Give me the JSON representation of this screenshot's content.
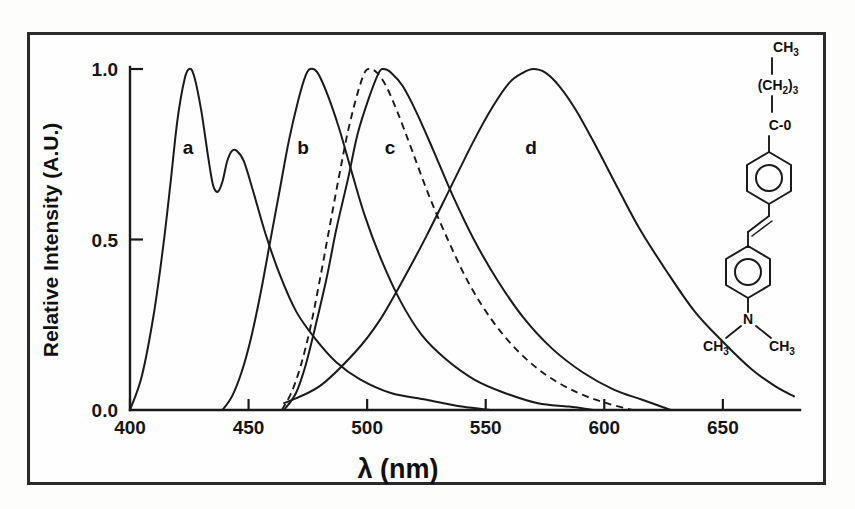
{
  "figure": {
    "frame_color": "#2b2b2b",
    "line_color": "#1a1a1a",
    "background": "#fefefe"
  },
  "axes": {
    "x_title": "λ (nm)",
    "y_title": "Relative Intensity (A.U.)",
    "x_ticks": [
      "400",
      "450",
      "500",
      "550",
      "600",
      "650"
    ],
    "y_ticks": [
      "0.0",
      "0.5",
      "1.0"
    ]
  },
  "curve_labels": [
    {
      "id": "a",
      "text": "a"
    },
    {
      "id": "b",
      "text": "b"
    },
    {
      "id": "c",
      "text": "c"
    },
    {
      "id": "d",
      "text": "d"
    }
  ],
  "molecule": {
    "name": "4-dimethylamino-4'-pentanoyl-stilbene",
    "labels": {
      "methyl_top": "CH",
      "methyl_top_sub": "3",
      "chain_open": "(CH",
      "chain_sub": "2",
      "chain_close": ")",
      "chain_count": "3",
      "carbonyl": "C-0",
      "nitrogen": "N",
      "methyl_left": "CH",
      "methyl_left_sub": "3",
      "methyl_right": "CH",
      "methyl_right_sub": "3"
    }
  },
  "chart_data": {
    "type": "line",
    "xlabel": "λ (nm)",
    "ylabel": "Relative Intensity (A.U.)",
    "xlim": [
      400,
      680
    ],
    "ylim": [
      0.0,
      1.0
    ],
    "grid": false,
    "legend": "inline curve labels a, b, c, d",
    "x_tick_values": [
      400,
      450,
      500,
      550,
      600,
      650
    ],
    "y_tick_values": [
      0.0,
      0.5,
      1.0
    ],
    "series": [
      {
        "name": "a",
        "style": "solid",
        "description": "vibronically structured absorption band with two maxima",
        "peak_nm": 425,
        "secondary_peak_nm": 443,
        "points": [
          [
            400,
            0.0
          ],
          [
            405,
            0.1
          ],
          [
            410,
            0.28
          ],
          [
            414,
            0.48
          ],
          [
            417,
            0.66
          ],
          [
            420,
            0.85
          ],
          [
            423,
            0.97
          ],
          [
            425,
            1.0
          ],
          [
            427,
            0.98
          ],
          [
            430,
            0.88
          ],
          [
            433,
            0.74
          ],
          [
            435,
            0.66
          ],
          [
            437,
            0.64
          ],
          [
            439,
            0.67
          ],
          [
            441,
            0.73
          ],
          [
            443,
            0.76
          ],
          [
            445,
            0.76
          ],
          [
            448,
            0.73
          ],
          [
            452,
            0.64
          ],
          [
            457,
            0.52
          ],
          [
            463,
            0.4
          ],
          [
            470,
            0.29
          ],
          [
            478,
            0.21
          ],
          [
            487,
            0.14
          ],
          [
            497,
            0.09
          ],
          [
            510,
            0.05
          ],
          [
            525,
            0.03
          ],
          [
            540,
            0.01
          ],
          [
            552,
            0.0
          ]
        ]
      },
      {
        "name": "b",
        "style": "solid",
        "description": "emission band",
        "peak_nm": 476,
        "points": [
          [
            439,
            0.0
          ],
          [
            443,
            0.04
          ],
          [
            447,
            0.11
          ],
          [
            451,
            0.21
          ],
          [
            455,
            0.34
          ],
          [
            459,
            0.49
          ],
          [
            463,
            0.64
          ],
          [
            467,
            0.79
          ],
          [
            471,
            0.91
          ],
          [
            474,
            0.98
          ],
          [
            476,
            1.0
          ],
          [
            479,
            0.99
          ],
          [
            483,
            0.93
          ],
          [
            488,
            0.83
          ],
          [
            493,
            0.71
          ],
          [
            499,
            0.57
          ],
          [
            506,
            0.44
          ],
          [
            514,
            0.32
          ],
          [
            523,
            0.22
          ],
          [
            533,
            0.15
          ],
          [
            545,
            0.09
          ],
          [
            558,
            0.05
          ],
          [
            572,
            0.02
          ],
          [
            585,
            0.01
          ],
          [
            596,
            0.0
          ]
        ]
      },
      {
        "name": "dashed",
        "style": "dashed",
        "description": "dashed reference band overlapping curve c, blue-shifted maximum",
        "peak_nm": 501,
        "points": [
          [
            464,
            0.0
          ],
          [
            468,
            0.05
          ],
          [
            472,
            0.13
          ],
          [
            476,
            0.24
          ],
          [
            480,
            0.38
          ],
          [
            484,
            0.53
          ],
          [
            488,
            0.68
          ],
          [
            492,
            0.82
          ],
          [
            496,
            0.93
          ],
          [
            499,
            0.99
          ],
          [
            501,
            1.0
          ],
          [
            504,
            0.99
          ],
          [
            508,
            0.95
          ],
          [
            513,
            0.87
          ],
          [
            519,
            0.76
          ],
          [
            526,
            0.63
          ],
          [
            534,
            0.5
          ],
          [
            543,
            0.37
          ],
          [
            553,
            0.26
          ],
          [
            564,
            0.17
          ],
          [
            576,
            0.1
          ],
          [
            589,
            0.05
          ],
          [
            601,
            0.02
          ],
          [
            612,
            0.0
          ]
        ]
      },
      {
        "name": "c",
        "style": "solid",
        "description": "emission band slightly red-shifted from dashed curve",
        "peak_nm": 507,
        "points": [
          [
            465,
            0.0
          ],
          [
            470,
            0.05
          ],
          [
            474,
            0.13
          ],
          [
            478,
            0.24
          ],
          [
            483,
            0.39
          ],
          [
            487,
            0.53
          ],
          [
            492,
            0.68
          ],
          [
            496,
            0.81
          ],
          [
            501,
            0.92
          ],
          [
            505,
            0.99
          ],
          [
            507,
            1.0
          ],
          [
            510,
            0.99
          ],
          [
            515,
            0.95
          ],
          [
            521,
            0.87
          ],
          [
            528,
            0.76
          ],
          [
            536,
            0.63
          ],
          [
            545,
            0.5
          ],
          [
            555,
            0.38
          ],
          [
            566,
            0.27
          ],
          [
            578,
            0.18
          ],
          [
            591,
            0.11
          ],
          [
            604,
            0.06
          ],
          [
            616,
            0.03
          ],
          [
            628,
            0.0
          ]
        ]
      },
      {
        "name": "d",
        "style": "solid",
        "description": "broad red-shifted emission band",
        "peak_nm": 570,
        "points": [
          [
            465,
            0.02
          ],
          [
            480,
            0.07
          ],
          [
            495,
            0.17
          ],
          [
            505,
            0.26
          ],
          [
            515,
            0.38
          ],
          [
            525,
            0.51
          ],
          [
            535,
            0.65
          ],
          [
            545,
            0.79
          ],
          [
            553,
            0.89
          ],
          [
            560,
            0.96
          ],
          [
            566,
            0.99
          ],
          [
            570,
            1.0
          ],
          [
            575,
            0.99
          ],
          [
            581,
            0.95
          ],
          [
            588,
            0.88
          ],
          [
            596,
            0.78
          ],
          [
            605,
            0.66
          ],
          [
            615,
            0.53
          ],
          [
            626,
            0.41
          ],
          [
            638,
            0.29
          ],
          [
            650,
            0.2
          ],
          [
            662,
            0.12
          ],
          [
            672,
            0.07
          ],
          [
            680,
            0.04
          ]
        ]
      }
    ]
  }
}
